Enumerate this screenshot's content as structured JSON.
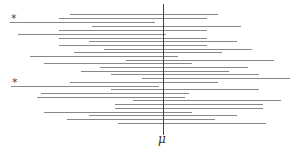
{
  "diagram": {
    "title": "",
    "center_label": "μ",
    "marker_symbol": "*",
    "center_x": 163,
    "line_color": "#888888",
    "center_line_color": "#444444",
    "intervals": [
      {
        "y": 14,
        "x1": 70,
        "x2": 218
      },
      {
        "y": 18,
        "x1": 59,
        "x2": 207
      },
      {
        "y": 22,
        "x1": 10,
        "x2": 155,
        "starred": true
      },
      {
        "y": 26,
        "x1": 92,
        "x2": 241
      },
      {
        "y": 30,
        "x1": 59,
        "x2": 207
      },
      {
        "y": 34,
        "x1": 18,
        "x2": 166
      },
      {
        "y": 38,
        "x1": 59,
        "x2": 207
      },
      {
        "y": 41,
        "x1": 89,
        "x2": 237
      },
      {
        "y": 45,
        "x1": 59,
        "x2": 207
      },
      {
        "y": 49,
        "x1": 104,
        "x2": 252
      },
      {
        "y": 52,
        "x1": 74,
        "x2": 222
      },
      {
        "y": 56,
        "x1": 30,
        "x2": 178
      },
      {
        "y": 60,
        "x1": 126,
        "x2": 274
      },
      {
        "y": 63,
        "x1": 44,
        "x2": 192
      },
      {
        "y": 67,
        "x1": 100,
        "x2": 248
      },
      {
        "y": 71,
        "x1": 81,
        "x2": 229
      },
      {
        "y": 74,
        "x1": 111,
        "x2": 259
      },
      {
        "y": 78,
        "x1": 142,
        "x2": 290
      },
      {
        "y": 82,
        "x1": 70,
        "x2": 218
      },
      {
        "y": 86,
        "x1": 11,
        "x2": 159,
        "starred": true
      },
      {
        "y": 89,
        "x1": 111,
        "x2": 259
      },
      {
        "y": 93,
        "x1": 41,
        "x2": 189
      },
      {
        "y": 97,
        "x1": 37,
        "x2": 185
      },
      {
        "y": 100,
        "x1": 133,
        "x2": 281
      },
      {
        "y": 104,
        "x1": 115,
        "x2": 263
      },
      {
        "y": 108,
        "x1": 115,
        "x2": 263
      },
      {
        "y": 112,
        "x1": 44,
        "x2": 192
      },
      {
        "y": 115,
        "x1": 89,
        "x2": 237
      },
      {
        "y": 119,
        "x1": 67,
        "x2": 215
      },
      {
        "y": 123,
        "x1": 118,
        "x2": 266
      }
    ]
  }
}
